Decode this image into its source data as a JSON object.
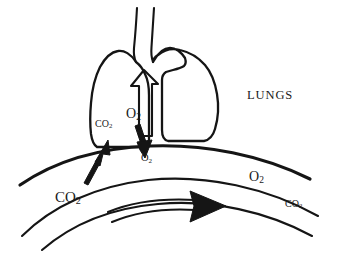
{
  "figure": {
    "background_color": "#ffffff",
    "ink_color": "#151515",
    "width": 341,
    "height": 254
  },
  "labels": {
    "lungs": "LUNGS",
    "co2_membrane": "CO₂",
    "o2_alveolar": "O₂",
    "o2_blood": "O₂",
    "co2_blood": "CO₂",
    "o2_vessel": "O₂",
    "co2_vessel": "CO₂"
  },
  "label_parts": {
    "co2_membrane": {
      "formula": "CO",
      "subscript": "2"
    },
    "o2_alveolar": {
      "formula": "O",
      "subscript": "2"
    },
    "o2_blood": {
      "formula": "O",
      "subscript": "2"
    },
    "co2_blood": {
      "formula": "CO",
      "subscript": "2"
    },
    "o2_vessel": {
      "formula": "O",
      "subscript": "2"
    },
    "co2_vessel": {
      "formula": "CO",
      "subscript": "2"
    }
  },
  "shapes": {
    "trachea": "two vertical tube lines rising from the lung hilum to the top edge",
    "lung_left_lobe": "rounded left lung lobe outline",
    "lung_right_lobe": "rounded right lung lobe outline, larger and lower",
    "inhalation_arrow": "hollow outlined arrow pointing up inside the trachea",
    "alveolar_membrane": "thick curved arc separating lungs from blood vessel",
    "vessel_outer": "upper curved blood vessel wall",
    "vessel_inner": "lower curved blood vessel wall",
    "co2_diffusion_arrow": "solid black arrow pointing up-right from blood into lung",
    "o2_diffusion_arrow": "solid black arrow pointing down from lung into blood",
    "blood_flow_arrow": "large solid black arrowhead with double-line shaft indicating blood flow to the right"
  }
}
